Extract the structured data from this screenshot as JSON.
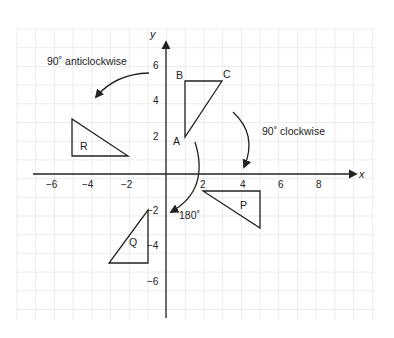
{
  "diagram": {
    "axes": {
      "x_label": "x",
      "y_label": "y",
      "x_ticks": [
        "−6",
        "−4",
        "−2",
        "2",
        "4",
        "6",
        "8"
      ],
      "y_ticks": [
        "6",
        "4",
        "2",
        "−2",
        "−4",
        "−6"
      ],
      "x_range": [
        -8,
        10
      ],
      "y_range": [
        -8,
        8
      ]
    },
    "shapes": {
      "ABC": {
        "vertices": {
          "A": [
            1,
            2
          ],
          "B": [
            1,
            5
          ],
          "C": [
            3,
            5
          ]
        },
        "labels": [
          "A",
          "B",
          "C"
        ]
      },
      "P": {
        "label": "P",
        "vertices": [
          [
            2,
            -1
          ],
          [
            5,
            -1
          ],
          [
            5,
            -3
          ]
        ]
      },
      "Q": {
        "label": "Q",
        "vertices": [
          [
            -1,
            -2
          ],
          [
            -1,
            -5
          ],
          [
            -3,
            -5
          ]
        ]
      },
      "R": {
        "label": "R",
        "vertices": [
          [
            -5,
            3
          ],
          [
            -5,
            1
          ],
          [
            -2,
            1
          ]
        ]
      }
    },
    "annotations": {
      "anticlockwise": "90˚ anticlockwise",
      "clockwise": "90˚ clockwise",
      "half_turn": "180˚"
    },
    "colors": {
      "line": "#222222",
      "grid": "#e6e6e6",
      "background": "#ffffff"
    }
  }
}
